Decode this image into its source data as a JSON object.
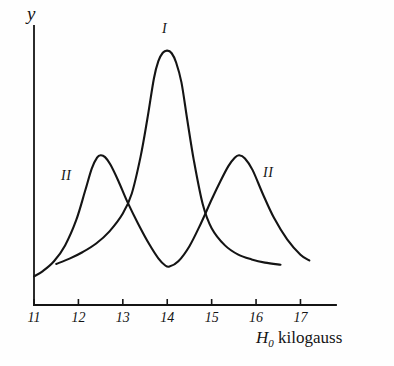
{
  "figure": {
    "background_color": "#fefefe",
    "stroke_color": "#141414",
    "axis_color": "#141414"
  },
  "axes": {
    "y_axis_title": "y",
    "x_axis_caption_symbol": "H",
    "x_axis_caption_subscript": "0",
    "x_axis_caption_unit": "kilogauss",
    "x_tick_labels": [
      "11",
      "12",
      "13",
      "14",
      "15",
      "16",
      "17"
    ]
  },
  "curve_labels": {
    "center": "I",
    "left": "II",
    "right": "II"
  },
  "chart_data": {
    "type": "line",
    "title": "",
    "xlabel": "H₀ kilogauss",
    "ylabel": "y",
    "xlim": [
      11,
      17.8
    ],
    "ylim": [
      0,
      1
    ],
    "grid": false,
    "legend": "inline-curve-labels",
    "x_ticks": [
      11,
      12,
      13,
      14,
      15,
      16,
      17
    ],
    "y_ticks": [],
    "annotations": [
      {
        "text": "I",
        "x": 14.0,
        "y": 1.0,
        "note": "label above central peak of curve I"
      },
      {
        "text": "II",
        "x": 11.78,
        "y": 0.56,
        "note": "label left of first hump of curve II"
      },
      {
        "text": "II",
        "x": 16.3,
        "y": 0.57,
        "note": "label right of second hump of curve II"
      }
    ],
    "series": [
      {
        "name": "I",
        "label": "I",
        "description": "single narrow tall resonance peak centred at 14.0 kilogauss, tails truncated",
        "peak_x": [
          14.0
        ],
        "peak_y": [
          0.96
        ],
        "x_range": [
          11.5,
          16.55
        ],
        "x": [
          11.5,
          11.8,
          12.1,
          12.4,
          12.7,
          13.0,
          13.2,
          13.4,
          13.55,
          13.7,
          13.8,
          13.9,
          14.0,
          14.1,
          14.2,
          14.32,
          14.45,
          14.6,
          14.8,
          15.0,
          15.3,
          15.6,
          15.9,
          16.2,
          16.55
        ],
        "y": [
          0.155,
          0.175,
          0.2,
          0.232,
          0.278,
          0.345,
          0.42,
          0.56,
          0.7,
          0.855,
          0.92,
          0.952,
          0.96,
          0.95,
          0.915,
          0.84,
          0.7,
          0.545,
          0.38,
          0.29,
          0.225,
          0.19,
          0.172,
          0.16,
          0.152
        ]
      },
      {
        "name": "II",
        "label": "II",
        "description": "double-humped curve with maxima at 12.5 and 15.6 kilogauss and a minimum at 14.0",
        "peak_x": [
          12.5,
          15.6
        ],
        "peak_y": [
          0.565,
          0.565
        ],
        "valley_x": [
          14.0
        ],
        "valley_y": [
          0.145
        ],
        "x_range": [
          11.0,
          17.2
        ],
        "x": [
          11.0,
          11.2,
          11.45,
          11.7,
          11.95,
          12.15,
          12.3,
          12.42,
          12.5,
          12.6,
          12.72,
          12.9,
          13.1,
          13.35,
          13.6,
          13.8,
          13.95,
          14.05,
          14.25,
          14.5,
          14.75,
          15.0,
          15.2,
          15.38,
          15.52,
          15.62,
          15.75,
          15.92,
          16.15,
          16.4,
          16.7,
          17.0,
          17.2
        ],
        "y": [
          0.108,
          0.128,
          0.165,
          0.225,
          0.32,
          0.43,
          0.515,
          0.556,
          0.565,
          0.558,
          0.53,
          0.468,
          0.39,
          0.305,
          0.228,
          0.176,
          0.15,
          0.145,
          0.165,
          0.222,
          0.305,
          0.398,
          0.468,
          0.525,
          0.556,
          0.565,
          0.553,
          0.51,
          0.42,
          0.33,
          0.248,
          0.19,
          0.168
        ]
      }
    ],
    "crossings": [
      {
        "x": 13.2,
        "y": 0.42,
        "between": [
          "I",
          "II"
        ]
      },
      {
        "x": 14.85,
        "y": 0.35,
        "between": [
          "I",
          "II"
        ]
      }
    ]
  }
}
